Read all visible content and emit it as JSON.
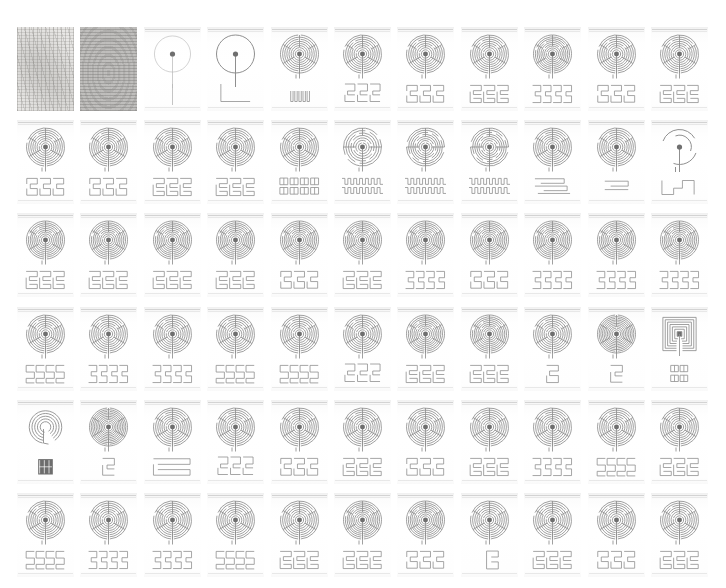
{
  "plate": {
    "title": "Labyrinth typology plate",
    "description": "Grid of labyrinth diagrams: circular labyrinth figure above its linear seed-pattern diagram",
    "rows": 6,
    "columns": 11,
    "cell_count": 66,
    "background_color": "#ffffff",
    "line_color": "#8f8f8f",
    "line_color_light": "#b6b6b6",
    "line_color_dark": "#6f6f6f"
  },
  "cells": [
    {
      "index": 1,
      "row": 1,
      "col": 1,
      "kind": "texture-scan",
      "figure": "noise-light",
      "seed": "none"
    },
    {
      "index": 2,
      "row": 1,
      "col": 2,
      "kind": "texture-scan",
      "figure": "noise-dark",
      "seed": "none"
    },
    {
      "index": 3,
      "row": 1,
      "col": 3,
      "kind": "labyrinth",
      "figure": "circle-faint",
      "circuits": 0,
      "seed": "line"
    },
    {
      "index": 4,
      "row": 1,
      "col": 4,
      "kind": "labyrinth",
      "figure": "circle-bold",
      "circuits": 0,
      "seed": "corner-L"
    },
    {
      "index": 5,
      "row": 1,
      "col": 5,
      "kind": "labyrinth",
      "figure": "spiral",
      "circuits": 7,
      "seed": "comb-small"
    },
    {
      "index": 6,
      "row": 1,
      "col": 6,
      "kind": "labyrinth",
      "figure": "classical",
      "circuits": 7,
      "seed": "meander-a"
    },
    {
      "index": 7,
      "row": 1,
      "col": 7,
      "kind": "labyrinth",
      "figure": "classical",
      "circuits": 7,
      "seed": "meander-b"
    },
    {
      "index": 8,
      "row": 1,
      "col": 8,
      "kind": "labyrinth",
      "figure": "classical",
      "circuits": 7,
      "seed": "meander-c"
    },
    {
      "index": 9,
      "row": 1,
      "col": 9,
      "kind": "labyrinth",
      "figure": "classical",
      "circuits": 8,
      "seed": "meander-d"
    },
    {
      "index": 10,
      "row": 1,
      "col": 10,
      "kind": "labyrinth",
      "figure": "classical",
      "circuits": 7,
      "seed": "meander-b"
    },
    {
      "index": 11,
      "row": 1,
      "col": 11,
      "kind": "labyrinth",
      "figure": "classical",
      "circuits": 7,
      "seed": "meander-c"
    },
    {
      "index": 12,
      "row": 2,
      "col": 1,
      "kind": "labyrinth",
      "figure": "classical",
      "circuits": 7,
      "seed": "meander-b"
    },
    {
      "index": 13,
      "row": 2,
      "col": 2,
      "kind": "labyrinth",
      "figure": "classical",
      "circuits": 7,
      "seed": "meander-b"
    },
    {
      "index": 14,
      "row": 2,
      "col": 3,
      "kind": "labyrinth",
      "figure": "classical",
      "circuits": 7,
      "seed": "meander-c"
    },
    {
      "index": 15,
      "row": 2,
      "col": 4,
      "kind": "labyrinth",
      "figure": "classical",
      "circuits": 7,
      "seed": "meander-c"
    },
    {
      "index": 16,
      "row": 2,
      "col": 5,
      "kind": "labyrinth",
      "figure": "classical",
      "circuits": 7,
      "seed": "meander-blocks"
    },
    {
      "index": 17,
      "row": 2,
      "col": 6,
      "kind": "labyrinth",
      "figure": "spiral-multi",
      "circuits": 6,
      "seed": "zigzag-thin"
    },
    {
      "index": 18,
      "row": 2,
      "col": 7,
      "kind": "labyrinth",
      "figure": "spiral-multi",
      "circuits": 7,
      "seed": "zigzag"
    },
    {
      "index": 19,
      "row": 2,
      "col": 8,
      "kind": "labyrinth",
      "figure": "spiral-multi",
      "circuits": 7,
      "seed": "zigzag"
    },
    {
      "index": 20,
      "row": 2,
      "col": 9,
      "kind": "labyrinth",
      "figure": "classical",
      "circuits": 7,
      "seed": "stack"
    },
    {
      "index": 21,
      "row": 2,
      "col": 10,
      "kind": "labyrinth",
      "figure": "classical",
      "circuits": 7,
      "seed": "short-bar"
    },
    {
      "index": 22,
      "row": 2,
      "col": 11,
      "kind": "labyrinth",
      "figure": "partial-arcs",
      "circuits": 2,
      "seed": "corner-step"
    },
    {
      "index": 23,
      "row": 3,
      "col": 1,
      "kind": "labyrinth",
      "figure": "classical",
      "circuits": 8,
      "seed": "meander-c"
    },
    {
      "index": 24,
      "row": 3,
      "col": 2,
      "kind": "labyrinth",
      "figure": "classical",
      "circuits": 8,
      "seed": "meander-c"
    },
    {
      "index": 25,
      "row": 3,
      "col": 3,
      "kind": "labyrinth",
      "figure": "classical",
      "circuits": 8,
      "seed": "meander-c"
    },
    {
      "index": 26,
      "row": 3,
      "col": 4,
      "kind": "labyrinth",
      "figure": "classical",
      "circuits": 8,
      "seed": "meander-c"
    },
    {
      "index": 27,
      "row": 3,
      "col": 5,
      "kind": "labyrinth",
      "figure": "classical",
      "circuits": 8,
      "seed": "meander-b"
    },
    {
      "index": 28,
      "row": 3,
      "col": 6,
      "kind": "labyrinth",
      "figure": "classical",
      "circuits": 8,
      "seed": "meander-c"
    },
    {
      "index": 29,
      "row": 3,
      "col": 7,
      "kind": "labyrinth",
      "figure": "classical",
      "circuits": 8,
      "seed": "meander-d"
    },
    {
      "index": 30,
      "row": 3,
      "col": 8,
      "kind": "labyrinth",
      "figure": "classical",
      "circuits": 8,
      "seed": "meander-b"
    },
    {
      "index": 31,
      "row": 3,
      "col": 9,
      "kind": "labyrinth",
      "figure": "classical",
      "circuits": 8,
      "seed": "meander-d"
    },
    {
      "index": 32,
      "row": 3,
      "col": 10,
      "kind": "labyrinth",
      "figure": "classical",
      "circuits": 8,
      "seed": "meander-d"
    },
    {
      "index": 33,
      "row": 3,
      "col": 11,
      "kind": "labyrinth",
      "figure": "classical",
      "circuits": 8,
      "seed": "meander-d"
    },
    {
      "index": 34,
      "row": 4,
      "col": 1,
      "kind": "labyrinth",
      "figure": "classical",
      "circuits": 7,
      "seed": "sss"
    },
    {
      "index": 35,
      "row": 4,
      "col": 2,
      "kind": "labyrinth",
      "figure": "classical",
      "circuits": 7,
      "seed": "meander-d"
    },
    {
      "index": 36,
      "row": 4,
      "col": 3,
      "kind": "labyrinth",
      "figure": "classical",
      "circuits": 7,
      "seed": "meander-d"
    },
    {
      "index": 37,
      "row": 4,
      "col": 4,
      "kind": "labyrinth",
      "figure": "classical",
      "circuits": 7,
      "seed": "sss"
    },
    {
      "index": 38,
      "row": 4,
      "col": 5,
      "kind": "labyrinth",
      "figure": "classical",
      "circuits": 7,
      "seed": "sss"
    },
    {
      "index": 39,
      "row": 4,
      "col": 6,
      "kind": "labyrinth",
      "figure": "classical",
      "circuits": 7,
      "seed": "meander-a"
    },
    {
      "index": 40,
      "row": 4,
      "col": 7,
      "kind": "labyrinth",
      "figure": "classical",
      "circuits": 8,
      "seed": "meander-c"
    },
    {
      "index": 41,
      "row": 4,
      "col": 8,
      "kind": "labyrinth",
      "figure": "classical",
      "circuits": 8,
      "seed": "meander-c"
    },
    {
      "index": 42,
      "row": 4,
      "col": 9,
      "kind": "labyrinth",
      "figure": "classical",
      "circuits": 7,
      "seed": "narrow"
    },
    {
      "index": 43,
      "row": 4,
      "col": 10,
      "kind": "labyrinth",
      "figure": "concentric",
      "circuits": 9,
      "seed": "hook"
    },
    {
      "index": 44,
      "row": 4,
      "col": 11,
      "kind": "labyrinth",
      "figure": "square",
      "circuits": 7,
      "seed": "blocks-small"
    },
    {
      "index": 45,
      "row": 5,
      "col": 1,
      "kind": "labyrinth",
      "figure": "spiral-open",
      "circuits": 5,
      "seed": "block-dark"
    },
    {
      "index": 46,
      "row": 5,
      "col": 2,
      "kind": "labyrinth",
      "figure": "concentric",
      "circuits": 9,
      "seed": "hook"
    },
    {
      "index": 47,
      "row": 5,
      "col": 3,
      "kind": "labyrinth",
      "figure": "classical",
      "circuits": 7,
      "seed": "wide-bar"
    },
    {
      "index": 48,
      "row": 5,
      "col": 4,
      "kind": "labyrinth",
      "figure": "classical",
      "circuits": 7,
      "seed": "meander-a"
    },
    {
      "index": 49,
      "row": 5,
      "col": 5,
      "kind": "labyrinth",
      "figure": "classical",
      "circuits": 7,
      "seed": "meander-b"
    },
    {
      "index": 50,
      "row": 5,
      "col": 6,
      "kind": "labyrinth",
      "figure": "classical",
      "circuits": 7,
      "seed": "meander-c"
    },
    {
      "index": 51,
      "row": 5,
      "col": 7,
      "kind": "labyrinth",
      "figure": "classical",
      "circuits": 7,
      "seed": "meander-b"
    },
    {
      "index": 52,
      "row": 5,
      "col": 8,
      "kind": "labyrinth",
      "figure": "classical",
      "circuits": 7,
      "seed": "meander-c"
    },
    {
      "index": 53,
      "row": 5,
      "col": 9,
      "kind": "labyrinth",
      "figure": "classical",
      "circuits": 7,
      "seed": "meander-d"
    },
    {
      "index": 54,
      "row": 5,
      "col": 10,
      "kind": "labyrinth",
      "figure": "classical",
      "circuits": 7,
      "seed": "sss"
    },
    {
      "index": 55,
      "row": 5,
      "col": 11,
      "kind": "labyrinth",
      "figure": "classical",
      "circuits": 7,
      "seed": "meander-c"
    },
    {
      "index": 56,
      "row": 6,
      "col": 1,
      "kind": "labyrinth",
      "figure": "classical",
      "circuits": 7,
      "seed": "sss"
    },
    {
      "index": 57,
      "row": 6,
      "col": 2,
      "kind": "labyrinth",
      "figure": "classical",
      "circuits": 7,
      "seed": "meander-d"
    },
    {
      "index": 58,
      "row": 6,
      "col": 3,
      "kind": "labyrinth",
      "figure": "classical",
      "circuits": 7,
      "seed": "meander-d"
    },
    {
      "index": 59,
      "row": 6,
      "col": 4,
      "kind": "labyrinth",
      "figure": "classical",
      "circuits": 7,
      "seed": "sss"
    },
    {
      "index": 60,
      "row": 6,
      "col": 5,
      "kind": "labyrinth",
      "figure": "classical",
      "circuits": 7,
      "seed": "meander-c"
    },
    {
      "index": 61,
      "row": 6,
      "col": 6,
      "kind": "labyrinth",
      "figure": "classical",
      "circuits": 8,
      "seed": "meander-c"
    },
    {
      "index": 62,
      "row": 6,
      "col": 7,
      "kind": "labyrinth",
      "figure": "classical",
      "circuits": 8,
      "seed": "meander-b"
    },
    {
      "index": 63,
      "row": 6,
      "col": 8,
      "kind": "labyrinth",
      "figure": "classical",
      "circuits": 7,
      "seed": "tail"
    },
    {
      "index": 64,
      "row": 6,
      "col": 9,
      "kind": "labyrinth",
      "figure": "classical",
      "circuits": 7,
      "seed": "meander-c"
    },
    {
      "index": 65,
      "row": 6,
      "col": 10,
      "kind": "labyrinth",
      "figure": "classical",
      "circuits": 7,
      "seed": "meander-b"
    },
    {
      "index": 66,
      "row": 6,
      "col": 11,
      "kind": "labyrinth",
      "figure": "classical",
      "circuits": 7,
      "seed": "meander-c"
    }
  ]
}
